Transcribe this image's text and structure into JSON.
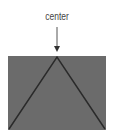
{
  "diagram": {
    "label": "center",
    "colors": {
      "fill": "#6b6b6b",
      "stroke": "#2a2a2a",
      "arrow": "#555555",
      "text": "#444444"
    },
    "rect": {
      "x": 8,
      "y": 56,
      "width": 98,
      "height": 74
    },
    "apex": {
      "x": 57,
      "y": 57
    },
    "arrow": {
      "x": 57,
      "y1": 27,
      "y2": 51
    }
  }
}
